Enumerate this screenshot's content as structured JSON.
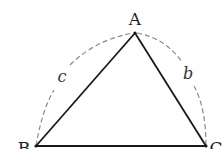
{
  "diagram": {
    "type": "geometry-triangle",
    "vertices": [
      {
        "name": "A",
        "x": 135,
        "y": 33,
        "label_x": 135,
        "label_y": 24
      },
      {
        "name": "B",
        "x": 36,
        "y": 146,
        "label_x": 24,
        "label_y": 153
      },
      {
        "name": "C",
        "x": 206,
        "y": 146,
        "label_x": 215,
        "label_y": 153
      }
    ],
    "sides": [
      {
        "name": "AB",
        "style": "solid"
      },
      {
        "name": "AC",
        "style": "solid"
      },
      {
        "name": "BC",
        "style": "solid"
      }
    ],
    "arcs": [
      {
        "label": "c",
        "from": "B",
        "to": "A",
        "style": "dashed"
      },
      {
        "label": "b",
        "from": "A",
        "to": "C",
        "style": "dashed"
      }
    ],
    "labels": {
      "A": "A",
      "B": "B",
      "C": "C",
      "c": "c",
      "b": "b"
    },
    "colors": {
      "line": "#1a1a1a",
      "dashed": "#888888",
      "background": "#ffffff"
    }
  }
}
